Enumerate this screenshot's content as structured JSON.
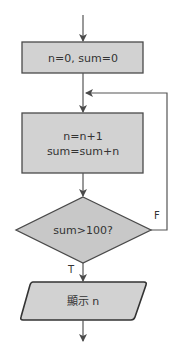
{
  "flowchart": {
    "colors": {
      "fill": "#d2d2d2",
      "stroke": "#4a4a4a",
      "line": "#555555",
      "text": "#333333"
    },
    "nodes": [
      {
        "id": "init",
        "shape": "process",
        "lines": [
          "n=0, sum=0"
        ]
      },
      {
        "id": "update",
        "shape": "process",
        "lines": [
          "n=n+1",
          "sum=sum+n"
        ]
      },
      {
        "id": "check",
        "shape": "decision",
        "lines": [
          "sum>100?"
        ]
      },
      {
        "id": "output",
        "shape": "io",
        "lines": [
          "顯示 n"
        ]
      }
    ],
    "edges": [
      {
        "from": "start",
        "to": "init"
      },
      {
        "from": "init",
        "to": "update"
      },
      {
        "from": "update",
        "to": "check"
      },
      {
        "from": "check",
        "to": "update",
        "label": "F"
      },
      {
        "from": "check",
        "to": "output",
        "label": "T"
      },
      {
        "from": "output",
        "to": "end"
      }
    ],
    "labels": {
      "init": "n=0, sum=0",
      "update_line1": "n=n+1",
      "update_line2": "sum=sum+n",
      "check": "sum>100?",
      "output": "顯示 n",
      "false_branch": "F",
      "true_branch": "T"
    }
  }
}
